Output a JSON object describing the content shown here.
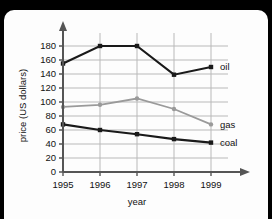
{
  "card": {
    "background_color": "#fdfdfd",
    "frame_color": "#000000"
  },
  "chart_data": {
    "type": "line",
    "title": "",
    "xlabel": "year",
    "ylabel": "price (US dollars)",
    "categories": [
      "1995",
      "1996",
      "1997",
      "1998",
      "1999"
    ],
    "x": [
      1995,
      1996,
      1997,
      1998,
      1999
    ],
    "xlim": [
      1995,
      1999
    ],
    "ylim": [
      0,
      190
    ],
    "yticks": [
      0,
      20,
      40,
      60,
      80,
      100,
      120,
      140,
      160,
      180
    ],
    "ytick_labels": [
      "0",
      "20",
      "40",
      "60",
      "80",
      "100",
      "120",
      "140",
      "160",
      "180"
    ],
    "grid": true,
    "grid_color": "#b9b9b9",
    "legend_position": "right-inline-labels",
    "series": [
      {
        "name": "oil",
        "label": "oil",
        "color": "#1a1a1a",
        "marker": "square",
        "values": [
          155,
          180,
          180,
          139,
          150
        ]
      },
      {
        "name": "gas",
        "label": "gas",
        "color": "#9a9a9a",
        "marker": "circle",
        "values": [
          93,
          96,
          105,
          90,
          68
        ]
      },
      {
        "name": "coal",
        "label": "coal",
        "color": "#1a1a1a",
        "marker": "square",
        "values": [
          68,
          60,
          54,
          47,
          42
        ]
      }
    ]
  }
}
